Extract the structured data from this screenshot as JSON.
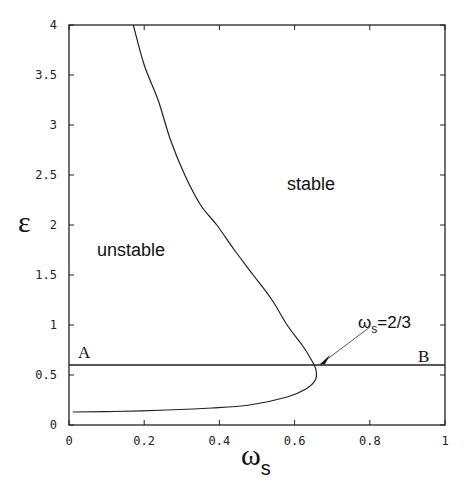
{
  "chart_data": {
    "type": "line",
    "title": "",
    "xlabel": "ωs",
    "ylabel": "ε",
    "xlim": [
      0,
      1
    ],
    "ylim": [
      0,
      4
    ],
    "xticks": [
      "0",
      "0.2",
      "0.4",
      "0.6",
      "0.8",
      "1"
    ],
    "yticks": [
      "0",
      "0.5",
      "1",
      "1.5",
      "2",
      "2.5",
      "3",
      "3.5",
      "4"
    ],
    "grid": false,
    "legend": null,
    "series": [
      {
        "name": "stability boundary",
        "points": [
          [
            0.171,
            4.0
          ],
          [
            0.2,
            3.6
          ],
          [
            0.237,
            3.25
          ],
          [
            0.27,
            2.85
          ],
          [
            0.308,
            2.5
          ],
          [
            0.35,
            2.2
          ],
          [
            0.393,
            2.0
          ],
          [
            0.44,
            1.75
          ],
          [
            0.49,
            1.5
          ],
          [
            0.54,
            1.25
          ],
          [
            0.58,
            1.0
          ],
          [
            0.62,
            0.8
          ],
          [
            0.645,
            0.65
          ],
          [
            0.657,
            0.55
          ],
          [
            0.655,
            0.45
          ],
          [
            0.63,
            0.36
          ],
          [
            0.58,
            0.28
          ],
          [
            0.48,
            0.2
          ],
          [
            0.38,
            0.17
          ],
          [
            0.26,
            0.15
          ],
          [
            0.12,
            0.135
          ],
          [
            0.01,
            0.13
          ]
        ]
      },
      {
        "name": "line A-B",
        "points": [
          [
            0.0,
            0.6
          ],
          [
            1.0,
            0.6
          ]
        ]
      }
    ],
    "annotations": [
      {
        "text": "stable",
        "x": 0.6,
        "y": 2.4
      },
      {
        "text": "unstable",
        "x": 0.2,
        "y": 1.7
      },
      {
        "text": "A",
        "x": 0.04,
        "y": 0.65
      },
      {
        "text": "B",
        "x": 0.955,
        "y": 0.64
      },
      {
        "text": "ωs=2/3",
        "x": 0.83,
        "y": 0.98,
        "arrow_to": [
          0.667,
          0.6
        ]
      }
    ]
  },
  "labels": {
    "stable": "stable",
    "unstable": "unstable",
    "A": "A",
    "B": "B",
    "omega": "ω",
    "sub_s": "s",
    "ann_rest": "=2/3",
    "ylabel": "ε"
  }
}
